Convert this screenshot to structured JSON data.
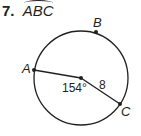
{
  "problem": {
    "number": "7.",
    "arc_name": "ABC"
  },
  "diagram": {
    "points": {
      "A": "A",
      "B": "B",
      "C": "C"
    },
    "central_angle": "154°",
    "radius_label": "8",
    "colors": {
      "stroke": "#231f20",
      "background": "#ffffff"
    }
  }
}
